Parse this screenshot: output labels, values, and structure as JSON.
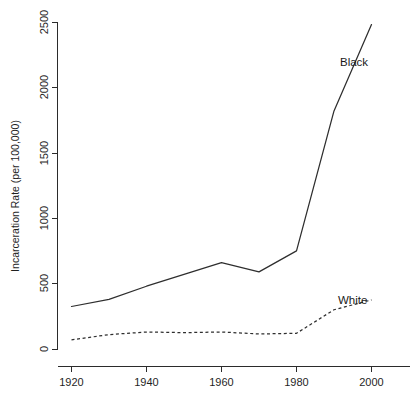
{
  "chart_data": {
    "type": "line",
    "title": "",
    "xlabel": "",
    "ylabel": "Incarceration Rate (per 100,000)",
    "xlim": [
      1920,
      2000
    ],
    "ylim": [
      0,
      2500
    ],
    "xticks": [
      1920,
      1940,
      1960,
      1980,
      2000
    ],
    "xtick_labels": [
      "1920",
      "1940",
      "1960",
      "1980",
      "2000"
    ],
    "yticks": [
      0,
      500,
      1000,
      1500,
      2000,
      2500
    ],
    "ytick_labels": [
      "0",
      "500",
      "1000",
      "1500",
      "2000",
      "2500"
    ],
    "grid": false,
    "legend": "inline-annotations",
    "x": [
      1920,
      1930,
      1940,
      1950,
      1960,
      1970,
      1980,
      1990,
      2000
    ],
    "series": [
      {
        "name": "Black",
        "style": "solid",
        "label": "Black",
        "values": [
          325,
          380,
          480,
          570,
          660,
          590,
          750,
          1820,
          2480
        ]
      },
      {
        "name": "White",
        "style": "dashed",
        "label": "White",
        "values": [
          70,
          110,
          130,
          125,
          130,
          115,
          120,
          300,
          375
        ]
      }
    ],
    "annotations": [
      {
        "text": "Black",
        "x": 1993,
        "y": 2180
      },
      {
        "text": "White",
        "x": 1992,
        "y": 480
      }
    ]
  }
}
